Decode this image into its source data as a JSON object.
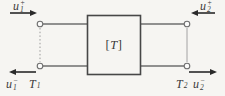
{
  "diagram": {
    "box": {
      "bracket_left": "[",
      "symbol": "T",
      "bracket_right": "]"
    },
    "ports": {
      "top_left_wave": {
        "base": "u",
        "sub": "1",
        "sup": "+"
      },
      "top_right_wave": {
        "base": "u",
        "sub": "2",
        "sup": "+"
      },
      "bottom_left_wave": {
        "base": "u",
        "sub": "1",
        "sup": "−"
      },
      "bottom_right_wave": {
        "base": "u",
        "sub": "2",
        "sup": "−"
      },
      "left_reference": {
        "base": "T",
        "sub": "1"
      },
      "right_reference": {
        "base": "T",
        "sub": "2"
      }
    },
    "colors": {
      "bg": "#f6f5f2",
      "line": "#6e6e6e",
      "accent": "#2a2a2a",
      "text": "#3a3a3a",
      "box_border": "#474747",
      "terminal_fill": "#fbfbfa",
      "guide": "#9a9a9a"
    }
  }
}
